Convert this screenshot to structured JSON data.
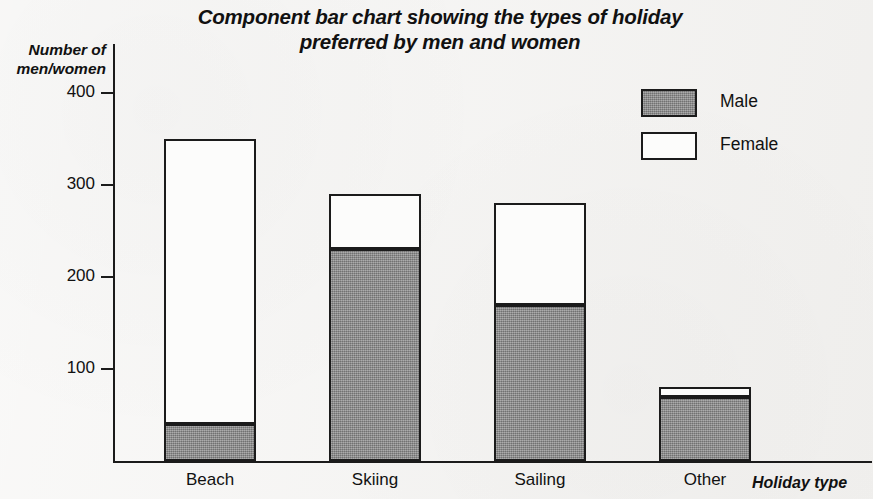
{
  "chart_data": {
    "type": "bar",
    "subtype": "stacked-component-bar",
    "title": "Component bar chart showing the types of holiday\npreferred by men and women",
    "xlabel": "Holiday type",
    "ylabel": "Number of\nmen/women",
    "categories": [
      "Beach",
      "Skiing",
      "Sailing",
      "Other"
    ],
    "series": [
      {
        "name": "Male",
        "color": "#8b8b8b",
        "values": [
          40,
          230,
          170,
          70
        ]
      },
      {
        "name": "Female",
        "color": "#fcfcfb",
        "values": [
          310,
          60,
          110,
          10
        ]
      }
    ],
    "totals": [
      350,
      290,
      280,
      80
    ],
    "ylim": [
      0,
      420
    ],
    "yticks": [
      100,
      200,
      300,
      400
    ],
    "ytick_labels": [
      "100",
      "200",
      "300",
      "400"
    ],
    "grid": false,
    "legend_position": "top-right",
    "legend": [
      {
        "label": "Male",
        "swatch": "gray-filled"
      },
      {
        "label": "Female",
        "swatch": "white-outlined"
      }
    ],
    "axis_color": "#1b1b1b",
    "background_color": "#f3f2f0"
  }
}
